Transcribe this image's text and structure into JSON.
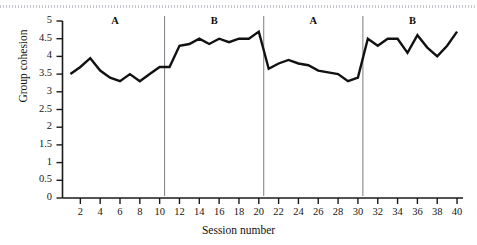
{
  "chart_data": {
    "type": "line",
    "title": "",
    "xlabel": "Session number",
    "ylabel": "Group cohesion",
    "xlim": [
      1,
      40
    ],
    "ylim": [
      0,
      5
    ],
    "grid": false,
    "legend_position": "none",
    "y_ticks": [
      "0",
      "0.5",
      "1",
      "1.5",
      "2",
      "2.5",
      "3",
      "3.5",
      "4",
      "4.5",
      "5"
    ],
    "y_tick_values": [
      0,
      0.5,
      1,
      1.5,
      2,
      2.5,
      3,
      3.5,
      4,
      4.5,
      5
    ],
    "x_ticks": [
      "2",
      "4",
      "6",
      "8",
      "10",
      "12",
      "14",
      "16",
      "18",
      "20",
      "22",
      "24",
      "26",
      "28",
      "30",
      "32",
      "34",
      "36",
      "38",
      "40"
    ],
    "x_tick_values": [
      2,
      4,
      6,
      8,
      10,
      12,
      14,
      16,
      18,
      20,
      22,
      24,
      26,
      28,
      30,
      32,
      34,
      36,
      38,
      40
    ],
    "x": [
      1,
      2,
      3,
      4,
      5,
      6,
      7,
      8,
      9,
      10,
      11,
      12,
      13,
      14,
      15,
      16,
      17,
      18,
      19,
      20,
      21,
      22,
      23,
      24,
      25,
      26,
      27,
      28,
      29,
      30,
      31,
      32,
      33,
      34,
      35,
      36,
      37,
      38,
      39,
      40
    ],
    "values": [
      3.5,
      3.7,
      3.95,
      3.6,
      3.4,
      3.3,
      3.5,
      3.3,
      3.5,
      3.7,
      3.7,
      4.3,
      4.35,
      4.5,
      4.35,
      4.5,
      4.4,
      4.5,
      4.5,
      4.7,
      3.65,
      3.8,
      3.9,
      3.8,
      3.75,
      3.6,
      3.55,
      3.5,
      3.3,
      3.4,
      4.5,
      4.3,
      4.5,
      4.5,
      4.1,
      4.6,
      4.25,
      4.0,
      4.3,
      4.7
    ],
    "series": [
      {
        "name": "Group cohesion",
        "values": [
          3.5,
          3.7,
          3.95,
          3.6,
          3.4,
          3.3,
          3.5,
          3.3,
          3.5,
          3.7,
          3.7,
          4.3,
          4.35,
          4.5,
          4.35,
          4.5,
          4.4,
          4.5,
          4.5,
          4.7,
          3.65,
          3.8,
          3.9,
          3.8,
          3.75,
          3.6,
          3.55,
          3.5,
          3.3,
          3.4,
          4.5,
          4.3,
          4.5,
          4.5,
          4.1,
          4.6,
          4.25,
          4.0,
          4.3,
          4.7
        ]
      }
    ],
    "phase_labels": [
      {
        "label": "A",
        "session_center": 5.5,
        "range": [
          1,
          10
        ]
      },
      {
        "label": "B",
        "session_center": 15.5,
        "range": [
          11,
          20
        ]
      },
      {
        "label": "A",
        "session_center": 25.5,
        "range": [
          21,
          30
        ]
      },
      {
        "label": "B",
        "session_center": 35.5,
        "range": [
          31,
          40
        ]
      }
    ],
    "phase_dividers": [
      10.5,
      20.5,
      30.5
    ],
    "line_color": "#111111",
    "axis_color": "#1a1a1a",
    "divider_color": "#7c7c86"
  }
}
